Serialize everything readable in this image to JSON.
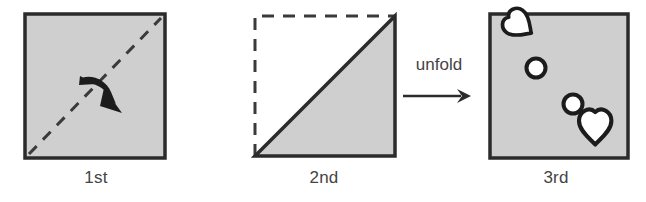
{
  "figure": {
    "background_color": "#ffffff",
    "paper_fill": "#cfcfcf",
    "outline_color": "#2b2b2b",
    "hole_fill": "#ffffff",
    "label_color": "#444444"
  },
  "panels": [
    {
      "id": "first-fold",
      "caption": "1st",
      "shape": "square",
      "shape_state": "unfolded-square-with-diagonal-crease",
      "crease": {
        "style": "dashed",
        "from": "bottom-left",
        "to": "top-right"
      },
      "fold_arrow": {
        "style": "curved-solid-arrow",
        "direction": "down-right",
        "meaning": "fold upper-left half down across diagonal"
      }
    },
    {
      "id": "second-fold",
      "caption": "2nd",
      "shape": "triangle",
      "shape_state": "folded-triangle-lower-right-half",
      "ghost_outline": {
        "style": "dashed",
        "shape": "square",
        "edges": [
          "top",
          "left"
        ],
        "meaning": "position of the folded-away upper-left half"
      }
    },
    {
      "id": "unfolded-result",
      "caption": "3rd",
      "shape": "square",
      "shape_state": "unfolded-square-with-punched-holes",
      "holes": [
        {
          "name": "heart-hole-top-left",
          "type": "heart",
          "x": 22,
          "y": 24,
          "size": 26,
          "rotation": -55
        },
        {
          "name": "circle-hole-upper",
          "type": "circle",
          "x": 48,
          "y": 54,
          "size": 19,
          "rotation": 0
        },
        {
          "name": "circle-hole-lower",
          "type": "circle",
          "x": 85,
          "y": 90,
          "size": 19,
          "rotation": 0
        },
        {
          "name": "heart-hole-bottom-right",
          "type": "heart",
          "x": 103,
          "y": 104,
          "size": 32,
          "rotation": 0
        }
      ],
      "hole_count": 4
    }
  ],
  "connector": {
    "label": "unfold",
    "arrow_direction": "right",
    "arrow_glyph": "→"
  }
}
